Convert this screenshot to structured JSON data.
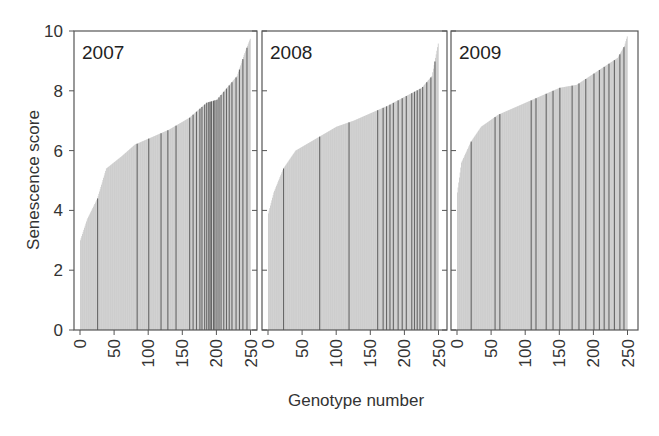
{
  "chart_data": {
    "type": "bar",
    "title": "",
    "xlabel": "Genotype number",
    "ylabel": "Senescence score",
    "ylim": [
      0,
      10
    ],
    "xlim": [
      0,
      255
    ],
    "yticks": [
      0,
      2,
      4,
      6,
      8,
      10
    ],
    "xticks": [
      0,
      50,
      100,
      150,
      200,
      250
    ],
    "grid": false,
    "legend": null,
    "layout": "three side-by-side panels sharing y-axis; bars sorted ascending by score; light grey bars with a subset of genotypes highlighted in dark grey",
    "colors": {
      "bar": "#c8c8c8",
      "highlight": "#555555",
      "frame": "#555555",
      "text": "#333333"
    },
    "panels": [
      {
        "label": "2007",
        "n_genotypes": 250,
        "curve_anchors": [
          [
            0,
            3.0
          ],
          [
            10,
            3.7
          ],
          [
            25,
            4.4
          ],
          [
            38,
            5.4
          ],
          [
            60,
            5.8
          ],
          [
            80,
            6.2
          ],
          [
            100,
            6.4
          ],
          [
            130,
            6.7
          ],
          [
            160,
            7.1
          ],
          [
            185,
            7.6
          ],
          [
            200,
            7.7
          ],
          [
            215,
            8.1
          ],
          [
            230,
            8.5
          ],
          [
            240,
            9.2
          ],
          [
            250,
            9.8
          ]
        ],
        "highlighted_genotypes": [
          25,
          83,
          100,
          118,
          128,
          140,
          160,
          165,
          170,
          175,
          178,
          182,
          185,
          188,
          190,
          192,
          195,
          197,
          200,
          203,
          206,
          210,
          214,
          218,
          222,
          228,
          233,
          238,
          244
        ]
      },
      {
        "label": "2008",
        "n_genotypes": 250,
        "curve_anchors": [
          [
            0,
            3.9
          ],
          [
            8,
            4.6
          ],
          [
            22,
            5.4
          ],
          [
            40,
            6.0
          ],
          [
            70,
            6.4
          ],
          [
            100,
            6.8
          ],
          [
            125,
            7.0
          ],
          [
            155,
            7.3
          ],
          [
            175,
            7.5
          ],
          [
            200,
            7.8
          ],
          [
            225,
            8.1
          ],
          [
            240,
            8.5
          ],
          [
            250,
            9.7
          ]
        ],
        "highlighted_genotypes": [
          22,
          75,
          118,
          160,
          168,
          173,
          178,
          183,
          190,
          196,
          202,
          210,
          214,
          218,
          222,
          226,
          232,
          238,
          244
        ]
      },
      {
        "label": "2009",
        "n_genotypes": 250,
        "curve_anchors": [
          [
            0,
            4.6
          ],
          [
            6,
            5.6
          ],
          [
            20,
            6.3
          ],
          [
            35,
            6.8
          ],
          [
            60,
            7.2
          ],
          [
            90,
            7.5
          ],
          [
            120,
            7.8
          ],
          [
            150,
            8.1
          ],
          [
            175,
            8.2
          ],
          [
            195,
            8.5
          ],
          [
            215,
            8.8
          ],
          [
            235,
            9.1
          ],
          [
            245,
            9.5
          ],
          [
            250,
            9.9
          ]
        ],
        "highlighted_genotypes": [
          20,
          55,
          62,
          108,
          115,
          130,
          140,
          150,
          168,
          178,
          188,
          200,
          208,
          215,
          222,
          230,
          238,
          244
        ]
      }
    ]
  },
  "axes": {
    "y_title": "Senescence score",
    "x_title": "Genotype number",
    "y_tick_labels": [
      "0",
      "2",
      "4",
      "6",
      "8",
      "10"
    ],
    "x_tick_labels": [
      "0",
      "50",
      "100",
      "150",
      "200",
      "250"
    ]
  },
  "panel_labels": [
    "2007",
    "2008",
    "2009"
  ]
}
